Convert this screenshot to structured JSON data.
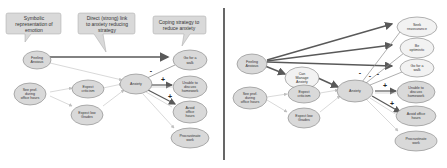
{
  "left_panel": {
    "callouts": [
      {
        "id": "c1",
        "lines": [
          "Symbolic",
          "representation of",
          "emotion"
        ]
      },
      {
        "id": "c2",
        "lines": [
          "Direct (strong) link",
          "to anxiety reducing",
          "strategy"
        ]
      },
      {
        "id": "c3",
        "lines": [
          "Coping strategy to",
          "reduce anxiety"
        ]
      }
    ],
    "nodes": [
      {
        "id": "feeling",
        "lines": [
          "Feeling",
          "Anxious"
        ]
      },
      {
        "id": "goforwalk",
        "lines": [
          "Go for a",
          "walk"
        ]
      },
      {
        "id": "seeprof",
        "lines": [
          "See prof.",
          "during",
          "office hours"
        ]
      },
      {
        "id": "expectcrit",
        "lines": [
          "Expect",
          "criticism"
        ]
      },
      {
        "id": "expectlow",
        "lines": [
          "Expect low",
          "Grades"
        ]
      },
      {
        "id": "anxiety",
        "lines": [
          "Anxiety"
        ]
      },
      {
        "id": "unable",
        "lines": [
          "Unable to",
          "discuss",
          "homework"
        ]
      },
      {
        "id": "avoid",
        "lines": [
          "Avoid",
          "office",
          "hours"
        ]
      },
      {
        "id": "procrastinate",
        "lines": [
          "Procrastinate",
          "work"
        ]
      }
    ],
    "signs": [
      "-",
      "+",
      "+"
    ]
  },
  "right_panel": {
    "nodes": [
      {
        "id": "feeling",
        "lines": [
          "Feeling",
          "Anxious"
        ]
      },
      {
        "id": "seek",
        "lines": [
          "Seek",
          "reassurance"
        ]
      },
      {
        "id": "beopt",
        "lines": [
          "Be",
          "optimistic"
        ]
      },
      {
        "id": "goforwalk",
        "lines": [
          "Go for a",
          "walk"
        ]
      },
      {
        "id": "canmanage",
        "lines": [
          "Can",
          "Manage",
          "Anxiety"
        ]
      },
      {
        "id": "seeprof",
        "lines": [
          "See prof.",
          "during",
          "office hours"
        ]
      },
      {
        "id": "expectcrit",
        "lines": [
          "Expect",
          "criticism"
        ]
      },
      {
        "id": "expectlow",
        "lines": [
          "Expect low",
          "Grades"
        ]
      },
      {
        "id": "anxiety",
        "lines": [
          "Anxiety"
        ]
      },
      {
        "id": "unable",
        "lines": [
          "Unable to",
          "discuss",
          "homework"
        ]
      },
      {
        "id": "avoid",
        "lines": [
          "Avoid office",
          "hours"
        ]
      },
      {
        "id": "procrastinate",
        "lines": [
          "Procrastinate",
          "work"
        ]
      }
    ],
    "signs": [
      "-",
      "-",
      "-",
      "+",
      "+"
    ]
  },
  "colors": {
    "node_fill": "#d9d9d9",
    "node_fill_light": "#f2f2f2",
    "node_stroke": "#7f7f7f",
    "callout_fill": "#d9d9d9",
    "arrow_dark": "#595959",
    "arrow_light": "#bfbfbf",
    "divider": "#404040"
  }
}
